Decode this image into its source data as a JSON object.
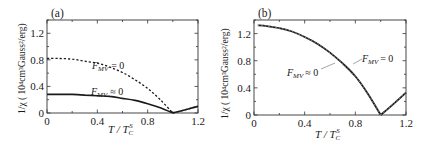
{
  "chart_data": [
    {
      "panel": "(a)",
      "type": "line",
      "xlabel": "T / T_C^S",
      "ylabel": "1/χ ( 10^4 cm^3 Gauss^2 /erg)",
      "xlim": [
        0,
        1.2
      ],
      "ylim": [
        0,
        1.4
      ],
      "xticks": [
        "0",
        "0.4",
        "0.8",
        "1.2"
      ],
      "yticks": [
        "0",
        "0.4",
        "0.8",
        "1.2"
      ],
      "grid": false,
      "series": [
        {
          "name": "F_MV = 0",
          "style": "dashed",
          "x": [
            0.0,
            0.1,
            0.2,
            0.3,
            0.4,
            0.5,
            0.6,
            0.7,
            0.8,
            0.9,
            1.0,
            1.1,
            1.2
          ],
          "y": [
            0.82,
            0.82,
            0.81,
            0.78,
            0.75,
            0.69,
            0.61,
            0.5,
            0.37,
            0.2,
            0.0,
            0.05,
            0.1
          ]
        },
        {
          "name": "F_MV ≠ 0",
          "style": "solid",
          "x": [
            0.0,
            0.1,
            0.2,
            0.3,
            0.4,
            0.5,
            0.6,
            0.7,
            0.8,
            0.9,
            1.0,
            1.1,
            1.2
          ],
          "y": [
            0.28,
            0.28,
            0.28,
            0.27,
            0.26,
            0.25,
            0.22,
            0.19,
            0.14,
            0.08,
            0.0,
            0.05,
            0.1
          ]
        }
      ],
      "annotations": [
        {
          "text": "F_MV = 0",
          "x": 0.66,
          "y": 0.82
        },
        {
          "text": "F_MV ≈ 0",
          "x": 0.6,
          "y": 0.34
        }
      ]
    },
    {
      "panel": "(b)",
      "type": "line",
      "xlabel": "T / T_C^S",
      "ylabel": "1/χ ( 10^4 cm^3 Gauss^2 /erg)",
      "xlim": [
        0,
        1.2
      ],
      "ylim": [
        0,
        1.4
      ],
      "xticks": [
        "0",
        "0.4",
        "0.8",
        "1.2"
      ],
      "yticks": [
        "0",
        "0.4",
        "0.8",
        "1.2"
      ],
      "grid": false,
      "series": [
        {
          "name": "F_MV = 0",
          "style": "dashed",
          "x": [
            0.03,
            0.1,
            0.2,
            0.3,
            0.4,
            0.5,
            0.6,
            0.7,
            0.8,
            0.9,
            1.0,
            1.1,
            1.2
          ],
          "y": [
            1.32,
            1.31,
            1.28,
            1.23,
            1.15,
            1.05,
            0.92,
            0.76,
            0.57,
            0.31,
            0.0,
            0.16,
            0.33
          ]
        },
        {
          "name": "F_MV ≈ 0",
          "style": "solid",
          "x": [
            0.03,
            0.1,
            0.2,
            0.3,
            0.4,
            0.5,
            0.6,
            0.7,
            0.8,
            0.9,
            1.0,
            1.1,
            1.2
          ],
          "y": [
            1.32,
            1.31,
            1.28,
            1.23,
            1.15,
            1.05,
            0.92,
            0.76,
            0.57,
            0.31,
            0.0,
            0.16,
            0.33
          ]
        }
      ],
      "annotations": [
        {
          "text": "F_MV = 0",
          "x": 0.9,
          "y": 0.82
        },
        {
          "text": "F_MV ≈ 0",
          "x": 0.42,
          "y": 0.68
        }
      ]
    }
  ],
  "labels": {
    "panel_a": "(a)",
    "panel_b": "(b)",
    "x_ticks": [
      "0",
      "0.4",
      "0.8",
      "1.2"
    ],
    "y_ticks": [
      "0",
      "0.4",
      "0.8",
      "1.2"
    ],
    "xlabel_main": "T / T",
    "xlabel_sub": "C",
    "xlabel_sup": "S",
    "ylabel_text": "1/χ ( 10⁴cm³Gauss²/erg)",
    "annot_eq": "= 0",
    "annot_approx": "≈ 0",
    "annot_F": "F",
    "annot_sub": "MV"
  }
}
